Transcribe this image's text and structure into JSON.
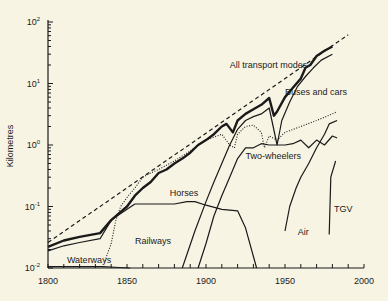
{
  "chart_data": {
    "type": "line",
    "title": "",
    "xlabel": "",
    "ylabel": "Kilometres",
    "xlim": [
      1800,
      2000
    ],
    "ylim": [
      0.01,
      100
    ],
    "yscale": "log",
    "grid": false,
    "legend": "inline labels",
    "x_ticks": [
      "1800",
      "1850",
      "1900",
      "1950",
      "2000"
    ],
    "y_ticks": [
      {
        "base": "10",
        "exp": "-2",
        "value": 0.01
      },
      {
        "base": "10",
        "exp": "-1",
        "value": 0.1
      },
      {
        "base": "10",
        "exp": "0",
        "value": 1
      },
      {
        "base": "10",
        "exp": "1",
        "value": 10
      },
      {
        "base": "10",
        "exp": "2",
        "value": 100
      }
    ],
    "series": [
      {
        "name": "Trend",
        "style": "dashed",
        "label": "",
        "points": [
          [
            1800,
            0.026
          ],
          [
            1990,
            62
          ]
        ]
      },
      {
        "name": "All transport modes",
        "style": "thick",
        "label": "All transport modes",
        "label_pos": [
          1915,
          18
        ],
        "points": [
          [
            1800,
            0.022
          ],
          [
            1810,
            0.028
          ],
          [
            1820,
            0.032
          ],
          [
            1833,
            0.037
          ],
          [
            1840,
            0.06
          ],
          [
            1850,
            0.1
          ],
          [
            1855,
            0.15
          ],
          [
            1860,
            0.2
          ],
          [
            1865,
            0.25
          ],
          [
            1870,
            0.35
          ],
          [
            1875,
            0.4
          ],
          [
            1880,
            0.5
          ],
          [
            1885,
            0.6
          ],
          [
            1890,
            0.75
          ],
          [
            1895,
            1.0
          ],
          [
            1900,
            1.2
          ],
          [
            1905,
            1.5
          ],
          [
            1910,
            2.0
          ],
          [
            1913,
            2.2
          ],
          [
            1917,
            1.6
          ],
          [
            1920,
            2.5
          ],
          [
            1925,
            3.2
          ],
          [
            1930,
            3.8
          ],
          [
            1935,
            4.5
          ],
          [
            1940,
            5.8
          ],
          [
            1943,
            3.0
          ],
          [
            1945,
            3.5
          ],
          [
            1950,
            6.0
          ],
          [
            1955,
            8.5
          ],
          [
            1960,
            12
          ],
          [
            1963,
            18
          ],
          [
            1966,
            20
          ],
          [
            1970,
            28
          ],
          [
            1975,
            34
          ],
          [
            1980,
            40
          ]
        ]
      },
      {
        "name": "Buses and cars",
        "style": "solid",
        "label": "Buses and cars",
        "label_pos": [
          1950,
          6.5
        ],
        "points": [
          [
            1885,
            0.01
          ],
          [
            1893,
            0.04
          ],
          [
            1900,
            0.12
          ],
          [
            1905,
            0.25
          ],
          [
            1910,
            0.5
          ],
          [
            1915,
            1.0
          ],
          [
            1920,
            1.8
          ],
          [
            1925,
            2.5
          ],
          [
            1930,
            2.9
          ],
          [
            1935,
            3.2
          ],
          [
            1940,
            4.0
          ],
          [
            1945,
            1.0
          ],
          [
            1948,
            2.5
          ],
          [
            1953,
            5.0
          ],
          [
            1958,
            9.0
          ],
          [
            1963,
            13
          ],
          [
            1968,
            18
          ],
          [
            1973,
            24
          ],
          [
            1980,
            30
          ]
        ]
      },
      {
        "name": "Railways",
        "style": "dotted",
        "label": "Railways",
        "label_pos": [
          1855,
          0.025
        ],
        "points": [
          [
            1836,
            0.013
          ],
          [
            1840,
            0.025
          ],
          [
            1843,
            0.06
          ],
          [
            1846,
            0.1
          ],
          [
            1850,
            0.14
          ],
          [
            1855,
            0.2
          ],
          [
            1860,
            0.3
          ],
          [
            1865,
            0.35
          ],
          [
            1870,
            0.4
          ],
          [
            1880,
            0.55
          ],
          [
            1890,
            0.8
          ],
          [
            1900,
            1.2
          ],
          [
            1910,
            1.5
          ],
          [
            1915,
            1.0
          ],
          [
            1918,
            0.9
          ],
          [
            1920,
            1.5
          ],
          [
            1925,
            2.0
          ],
          [
            1930,
            2.1
          ],
          [
            1935,
            1.6
          ],
          [
            1937,
            0.9
          ],
          [
            1940,
            1.4
          ],
          [
            1945,
            1.2
          ],
          [
            1950,
            1.6
          ],
          [
            1960,
            2.0
          ],
          [
            1970,
            2.5
          ],
          [
            1980,
            3.2
          ],
          [
            1983,
            3.5
          ]
        ]
      },
      {
        "name": "Horses",
        "style": "solid",
        "label": "Horses",
        "label_pos": [
          1877,
          0.15
        ],
        "points": [
          [
            1800,
            0.019
          ],
          [
            1810,
            0.023
          ],
          [
            1820,
            0.026
          ],
          [
            1833,
            0.03
          ],
          [
            1840,
            0.06
          ],
          [
            1850,
            0.09
          ],
          [
            1855,
            0.11
          ],
          [
            1860,
            0.11
          ],
          [
            1870,
            0.11
          ],
          [
            1880,
            0.11
          ],
          [
            1888,
            0.12
          ],
          [
            1893,
            0.12
          ],
          [
            1900,
            0.105
          ],
          [
            1910,
            0.09
          ],
          [
            1920,
            0.085
          ],
          [
            1925,
            0.045
          ],
          [
            1932,
            0.01
          ]
        ]
      },
      {
        "name": "Two-wheelers",
        "style": "solid",
        "label": "Two-wheelers",
        "label_pos": [
          1925,
          0.6
        ],
        "points": [
          [
            1895,
            0.01
          ],
          [
            1900,
            0.025
          ],
          [
            1905,
            0.07
          ],
          [
            1910,
            0.15
          ],
          [
            1915,
            0.3
          ],
          [
            1920,
            0.6
          ],
          [
            1925,
            0.9
          ],
          [
            1930,
            0.9
          ],
          [
            1935,
            1.05
          ],
          [
            1940,
            1.0
          ],
          [
            1945,
            1.0
          ],
          [
            1950,
            1.0
          ],
          [
            1955,
            1.05
          ],
          [
            1960,
            1.2
          ],
          [
            1965,
            0.9
          ],
          [
            1970,
            1.2
          ],
          [
            1975,
            1.0
          ],
          [
            1980,
            1.4
          ],
          [
            1983,
            1.3
          ]
        ]
      },
      {
        "name": "Air",
        "style": "solid",
        "label": "Air",
        "label_pos": [
          1958,
          0.035
        ],
        "points": [
          [
            1950,
            0.04
          ],
          [
            1953,
            0.1
          ],
          [
            1957,
            0.2
          ],
          [
            1960,
            0.3
          ],
          [
            1965,
            0.5
          ],
          [
            1970,
            0.9
          ],
          [
            1975,
            1.5
          ],
          [
            1978,
            2.2
          ],
          [
            1983,
            2.5
          ]
        ]
      },
      {
        "name": "TGV",
        "style": "solid",
        "label": "TGV",
        "label_pos": [
          1981,
          0.08
        ],
        "points": [
          [
            1978,
            0.035
          ],
          [
            1979,
            0.3
          ],
          [
            1982,
            0.55
          ]
        ]
      },
      {
        "name": "Waterways",
        "style": "solid",
        "label": "Waterways",
        "label_pos": [
          1812,
          0.012
        ],
        "points": [
          [
            1800,
            0.0105
          ],
          [
            1820,
            0.0105
          ],
          [
            1835,
            0.0105
          ],
          [
            1845,
            0.0102
          ],
          [
            1852,
            0.01
          ]
        ]
      }
    ]
  }
}
